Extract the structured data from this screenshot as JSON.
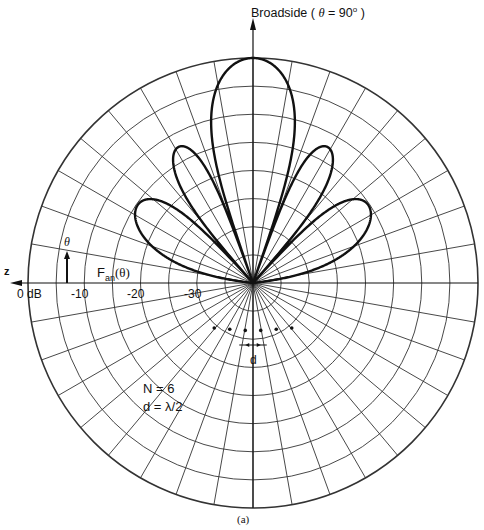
{
  "chart_data": {
    "type": "polar",
    "title_parts": {
      "prefix": "Broadside ( ",
      "theta": "θ",
      "mid": " = 90",
      "deg": "o",
      "suffix": " )"
    },
    "caption": "(a)",
    "radial_axis": {
      "unit": "dB",
      "range": [
        -40,
        0
      ],
      "ring_step_db": 5,
      "tick_labels": [
        "0 dB",
        "-10",
        "-20",
        "-30"
      ],
      "tick_values": [
        0,
        -10,
        -20,
        -30
      ]
    },
    "angular_axis": {
      "grid_step_deg": 10,
      "zero_direction": "left (z-axis)",
      "z_label": "z",
      "theta_label": "θ"
    },
    "series": [
      {
        "name": "Fan(θ)",
        "label_main": "F",
        "label_sub": "an",
        "label_arg": "(θ)",
        "description": "Normalized array factor, uniform broadside linear array",
        "N": 6,
        "d_over_lambda": 0.5,
        "main_lobe_db": 0,
        "main_lobe_theta_deg": 90,
        "sidelobes": [
          {
            "theta_deg": 48.2,
            "level_db": -12.4
          },
          {
            "theta_deg": 131.8,
            "level_db": -12.4
          },
          {
            "theta_deg": 25.8,
            "level_db": -16.0
          },
          {
            "theta_deg": 154.2,
            "level_db": -16.0
          }
        ],
        "nulls_deg": [
          0,
          48.2,
          70.5,
          109.5,
          131.8,
          180
        ],
        "plotted_half": "upper (0°–180°)"
      }
    ],
    "annotations": {
      "n_label": "N = 6",
      "d_label": "d = λ/2",
      "spacing_label": "d",
      "element_count": 6
    },
    "grid": true,
    "legend": null
  },
  "colors": {
    "background": "#ffffff",
    "grid": "#333333",
    "curve": "#111111",
    "text": "#111111"
  }
}
